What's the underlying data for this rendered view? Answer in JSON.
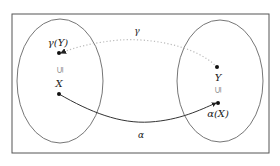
{
  "diagram": {
    "frame": {
      "x": 12,
      "y": 14,
      "w": 257,
      "h": 139,
      "stroke": "#555555"
    },
    "sets": [
      {
        "name": "left-set",
        "cx": 60,
        "cy": 81,
        "rx": 43,
        "ry": 62
      },
      {
        "name": "right-set",
        "cx": 220,
        "cy": 81,
        "rx": 43,
        "ry": 61
      }
    ],
    "points": [
      {
        "name": "gamma-of-Y",
        "x": 59,
        "y": 53,
        "label": "γ(Y)",
        "lx": 58,
        "ly": 46
      },
      {
        "name": "X",
        "x": 59,
        "y": 94,
        "label": "X",
        "lx": 59,
        "ly": 87
      },
      {
        "name": "Y",
        "x": 217,
        "y": 67,
        "label": "Y",
        "lx": 218,
        "ly": 81
      },
      {
        "name": "alpha-of-X",
        "x": 218,
        "y": 103,
        "label": "α(X)",
        "lx": 218,
        "ly": 117
      }
    ],
    "subset_marks": [
      {
        "x": 60,
        "y": 70,
        "glyph": "⊆"
      },
      {
        "x": 218,
        "y": 90,
        "glyph": "⊆"
      }
    ],
    "maps": [
      {
        "name": "gamma",
        "label": "γ",
        "style": "dotted",
        "from": "Y",
        "to": "gamma-of-Y",
        "lx": 137,
        "ly": 34,
        "color": "#bbbbbb"
      },
      {
        "name": "alpha",
        "label": "α",
        "style": "solid",
        "from": "X",
        "to": "alpha-of-X",
        "lx": 141,
        "ly": 138,
        "color": "#333333"
      }
    ]
  }
}
